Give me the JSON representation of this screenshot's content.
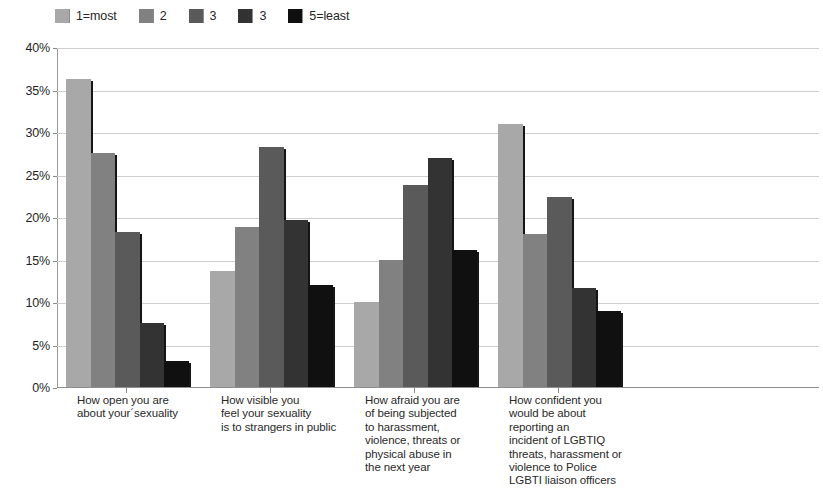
{
  "chart_data": {
    "type": "bar",
    "title": "",
    "subtitle": "",
    "xlabel": "",
    "ylabel": "",
    "ylim": [
      0,
      40
    ],
    "ytick_labels": [
      "0%",
      "5%",
      "10%",
      "15%",
      "20%",
      "25%",
      "30%",
      "35%",
      "40%"
    ],
    "ytick_values": [
      0,
      5,
      10,
      15,
      20,
      25,
      30,
      35,
      40
    ],
    "grid": true,
    "legend_position": "top-left",
    "value_unit": "percent",
    "categories": [
      "How open you are\nabout your´sexuality",
      "How visible you\nfeel your sexuality\nis to strangers in public",
      "How afraid you are\nof being subjected\nto harassment,\nviolence, threats or\nphysical abuse in\nthe next year",
      "How confident you\nwould be about\nreporting an\nincident of LGBTIQ\nthreats, harassment or\nviolence to Police\nLGBTI liaison officers"
    ],
    "series": [
      {
        "name": "1=most",
        "color": "#a8a8a8",
        "values": [
          36.2,
          13.7,
          10.0,
          30.9
        ]
      },
      {
        "name": "2",
        "color": "#818181",
        "values": [
          27.5,
          18.8,
          15.0,
          18.0
        ]
      },
      {
        "name": "3",
        "color": "#5a5a5a",
        "values": [
          18.2,
          28.2,
          23.8,
          22.4
        ]
      },
      {
        "name": "3",
        "color": "#333333",
        "values": [
          7.5,
          19.7,
          27.0,
          11.7
        ]
      },
      {
        "name": "5=least",
        "color": "#101010",
        "values": [
          3.1,
          12.0,
          16.1,
          8.9
        ]
      }
    ]
  },
  "colors": {
    "gridline": "#cfcfcf",
    "axis": "#8e8e8e",
    "text": "#2a2a2a",
    "background": "#ffffff"
  }
}
